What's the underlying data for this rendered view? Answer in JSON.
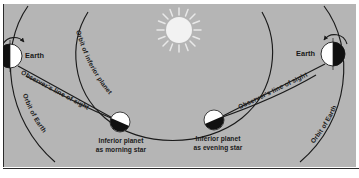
{
  "figure": {
    "background_color": "#b5b5b5",
    "ink_color": "#1a1a1a",
    "sun_color": "#f2f2f2"
  },
  "diagram_data": {
    "type": "diagram",
    "subject": "Elongation of an inferior planet as morning star and evening star",
    "bodies": [
      {
        "name": "Sun",
        "role": "sun",
        "x": 179,
        "y": 30,
        "radius": 13
      },
      {
        "name": "Earth",
        "role": "earth-left",
        "x": 10,
        "y": 56,
        "radius": 12,
        "lit_side": "right"
      },
      {
        "name": "Earth",
        "role": "earth-right",
        "x": 333,
        "y": 54,
        "radius": 12,
        "lit_side": "left"
      },
      {
        "name": "Inferior planet as morning star",
        "role": "planet-morning",
        "x": 120,
        "y": 122,
        "radius": 10,
        "lit_side": "upper-right"
      },
      {
        "name": "Inferior planet as evening star",
        "role": "planet-evening",
        "x": 214,
        "y": 120,
        "radius": 10,
        "lit_side": "upper-left"
      }
    ],
    "orbits": [
      "Orbit of inferior planet",
      "Orbit of Earth"
    ],
    "sight_lines": [
      "Observer's line of sight",
      "Observer's line of sight"
    ]
  },
  "labels": {
    "sun": "",
    "earth_left": "Earth",
    "earth_right": "Earth",
    "orbit_inferior_planet": "Orbit of inferior planet",
    "orbit_of_earth_left": "Orbit of Earth",
    "orbit_of_earth_right": "Orbit of Earth",
    "line_of_sight_left": "Observer's line of sight",
    "line_of_sight_right": "Observer's line of sight",
    "planet_morning_line1": "Inferior planet",
    "planet_morning_line2": "as morning star",
    "planet_evening_line1": "Inferior planet",
    "planet_evening_line2": "as evening star"
  }
}
